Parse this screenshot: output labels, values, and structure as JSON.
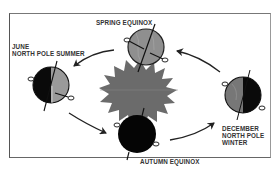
{
  "diagram": {
    "center": {
      "name": "Sun",
      "icon": "sun-icon",
      "color": "#6e6e6e"
    },
    "positions": [
      {
        "id": "spring",
        "label_lines": [
          "SPRING EQUINOX"
        ],
        "globe_lit": "half-front",
        "icon": "globe-icon"
      },
      {
        "id": "june",
        "label_lines": [
          "JUNE",
          "NORTH POLE SUMMER"
        ],
        "globe_lit": "right-half",
        "icon": "globe-icon"
      },
      {
        "id": "autumn",
        "label_lines": [
          "AUTUMN EQUINOX"
        ],
        "globe_lit": "none-visible",
        "icon": "globe-icon"
      },
      {
        "id": "december",
        "label_lines": [
          "DECEMBER",
          "NORTH POLE",
          "WINTER"
        ],
        "globe_lit": "left-half",
        "icon": "globe-icon"
      }
    ],
    "arrows": [
      {
        "from": "spring",
        "to": "june",
        "icon": "arrow-icon"
      },
      {
        "from": "june",
        "to": "autumn",
        "icon": "arrow-icon"
      },
      {
        "from": "autumn",
        "to": "december",
        "icon": "arrow-icon"
      },
      {
        "from": "december",
        "to": "spring",
        "icon": "arrow-icon"
      }
    ],
    "colors": {
      "dark_side": "#0a0a0a",
      "lit_side": "#9a9a9a",
      "sun": "#6b6b6b",
      "border": "#555555",
      "text": "#333333"
    }
  }
}
